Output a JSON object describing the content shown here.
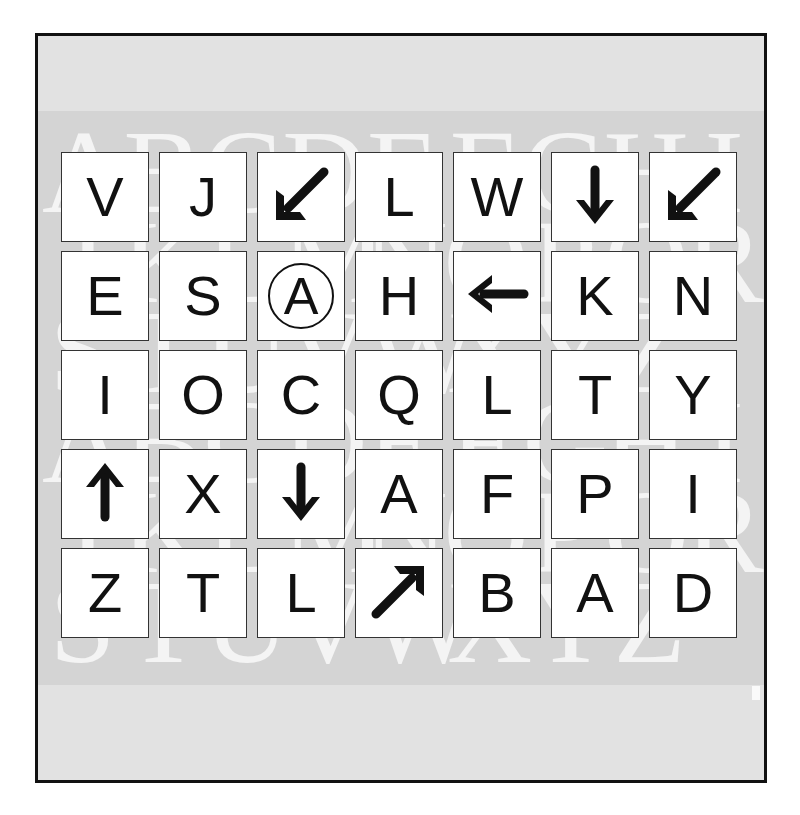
{
  "caption": "",
  "background_letters": {
    "rows": [
      [
        "A",
        "B",
        "C",
        "D",
        "E",
        "F",
        "G",
        "H",
        "I"
      ],
      [
        "J",
        "K",
        "L",
        "M",
        "N",
        "O",
        "P",
        "Q",
        "R"
      ],
      [
        "S",
        "T",
        "U",
        "V",
        "W",
        "X",
        "Y",
        "Z"
      ],
      [
        "A",
        "B",
        "C",
        "D",
        "E",
        "F",
        "G",
        "H",
        "I"
      ],
      [
        "J",
        "K",
        "L",
        "M",
        "N",
        "O",
        "P",
        "Q",
        "R"
      ],
      [
        "S",
        "T",
        "U",
        "V",
        "W",
        "X",
        "Y",
        "Z"
      ]
    ]
  },
  "grid": {
    "rows": [
      [
        {
          "type": "letter",
          "value": "V"
        },
        {
          "type": "letter",
          "value": "J"
        },
        {
          "type": "arrow",
          "direction": "down-left",
          "icon": "arrow-down-left-icon"
        },
        {
          "type": "letter",
          "value": "L"
        },
        {
          "type": "letter",
          "value": "W"
        },
        {
          "type": "arrow",
          "direction": "down",
          "icon": "arrow-down-icon"
        },
        {
          "type": "arrow",
          "direction": "down-left",
          "icon": "arrow-down-left-icon"
        }
      ],
      [
        {
          "type": "letter",
          "value": "E"
        },
        {
          "type": "letter",
          "value": "S"
        },
        {
          "type": "circled",
          "value": "A"
        },
        {
          "type": "letter",
          "value": "H"
        },
        {
          "type": "arrow",
          "direction": "left",
          "icon": "arrow-left-icon"
        },
        {
          "type": "letter",
          "value": "K"
        },
        {
          "type": "letter",
          "value": "N"
        }
      ],
      [
        {
          "type": "letter",
          "value": "I"
        },
        {
          "type": "letter",
          "value": "O"
        },
        {
          "type": "letter",
          "value": "C"
        },
        {
          "type": "letter",
          "value": "Q"
        },
        {
          "type": "letter",
          "value": "L"
        },
        {
          "type": "letter",
          "value": "T"
        },
        {
          "type": "letter",
          "value": "Y"
        }
      ],
      [
        {
          "type": "arrow",
          "direction": "up",
          "icon": "arrow-up-icon"
        },
        {
          "type": "letter",
          "value": "X"
        },
        {
          "type": "arrow",
          "direction": "down",
          "icon": "arrow-down-icon"
        },
        {
          "type": "letter",
          "value": "A"
        },
        {
          "type": "letter",
          "value": "F"
        },
        {
          "type": "letter",
          "value": "P"
        },
        {
          "type": "letter",
          "value": "I"
        }
      ],
      [
        {
          "type": "letter",
          "value": "Z"
        },
        {
          "type": "letter",
          "value": "T"
        },
        {
          "type": "letter",
          "value": "L"
        },
        {
          "type": "arrow",
          "direction": "up-right",
          "icon": "arrow-up-right-icon"
        },
        {
          "type": "letter",
          "value": "B"
        },
        {
          "type": "letter",
          "value": "A"
        },
        {
          "type": "letter",
          "value": "D"
        }
      ]
    ]
  },
  "colors": {
    "frame_border": "#111111",
    "panel_background": "#e2e2e2",
    "band_background": "#d4d4d4",
    "cell_background": "#ffffff",
    "glyph": "#111111"
  }
}
